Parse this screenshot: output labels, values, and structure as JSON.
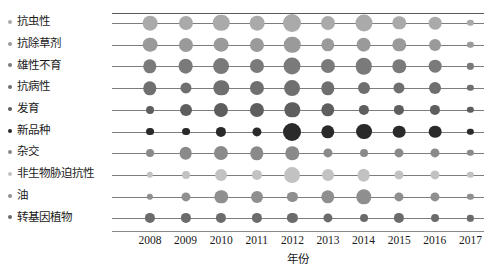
{
  "chart_data": {
    "type": "scatter",
    "title": "",
    "xlabel": "年份",
    "ylabel": "",
    "grid": true,
    "legend_position": "none",
    "x_axis_title": "年份",
    "categories": [
      "抗虫性",
      "抗除草剂",
      "雄性不育",
      "抗病性",
      "发育",
      "新品种",
      "杂交",
      "非生物胁迫抗性",
      "油",
      "转基因植物"
    ],
    "x": [
      "2008",
      "2009",
      "2010",
      "2011",
      "2012",
      "2013",
      "2014",
      "2015",
      "2016",
      "2017"
    ],
    "xlim": [
      "2008",
      "2017"
    ],
    "series": [
      {
        "name": "抗虫性",
        "color": "#aaaaaa",
        "values": [
          10,
          9,
          13,
          10,
          16,
          9,
          14,
          8,
          7,
          1
        ]
      },
      {
        "name": "抗除草剂",
        "color": "#9a9a9a",
        "values": [
          10,
          9,
          10,
          9,
          13,
          8,
          10,
          8,
          6,
          1
        ]
      },
      {
        "name": "雄性不育",
        "color": "#7a7a7a",
        "values": [
          8,
          10,
          12,
          9,
          14,
          9,
          13,
          8,
          7,
          1
        ]
      },
      {
        "name": "抗病性",
        "color": "#6f6f6f",
        "values": [
          8,
          5,
          11,
          9,
          12,
          8,
          6,
          5,
          6,
          1
        ]
      },
      {
        "name": "发育",
        "color": "#5e5e5e",
        "values": [
          2,
          6,
          9,
          9,
          11,
          8,
          4,
          4,
          4,
          1
        ]
      },
      {
        "name": "新品种",
        "color": "#2a2a2a",
        "values": [
          2,
          2,
          4,
          3,
          16,
          8,
          12,
          7,
          7,
          1
        ]
      },
      {
        "name": "杂交",
        "color": "#8a8a8a",
        "values": [
          2,
          7,
          9,
          8,
          8,
          3,
          2,
          3,
          3,
          1
        ]
      },
      {
        "name": "非生物胁迫抗性",
        "color": "#c2c2c2",
        "values": [
          1,
          2,
          6,
          4,
          12,
          6,
          7,
          3,
          3,
          1
        ]
      },
      {
        "name": "油",
        "color": "#8f8f8f",
        "values": [
          1,
          3,
          8,
          6,
          4,
          8,
          11,
          3,
          3,
          1
        ]
      },
      {
        "name": "转基因植物",
        "color": "#6b6b6b",
        "values": [
          4,
          4,
          4,
          4,
          4,
          3,
          2,
          4,
          2,
          1
        ]
      }
    ],
    "size_scale": {
      "min_radius_px": 1.2,
      "max_radius_px": 9.0,
      "max_value": 16
    },
    "axis_line_color": "#7d7d7d",
    "frame_top_color": "#5a5a5a",
    "background": "#ffffff"
  }
}
